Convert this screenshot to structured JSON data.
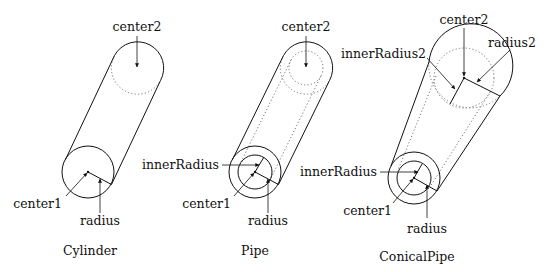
{
  "diagrams": [
    {
      "caption": "Cylinder",
      "labels": {
        "top_center": "center2",
        "bottom_center": "center1",
        "radius": "radius"
      }
    },
    {
      "caption": "Pipe",
      "labels": {
        "top_center": "center2",
        "inner_radius": "innerRadius",
        "bottom_center": "center1",
        "radius": "radius"
      }
    },
    {
      "caption": "ConicalPipe",
      "labels": {
        "top_center": "center2",
        "inner_radius2": "innerRadius2",
        "radius2": "radius2",
        "inner_radius": "innerRadius",
        "bottom_center": "center1",
        "radius": "radius"
      }
    }
  ]
}
